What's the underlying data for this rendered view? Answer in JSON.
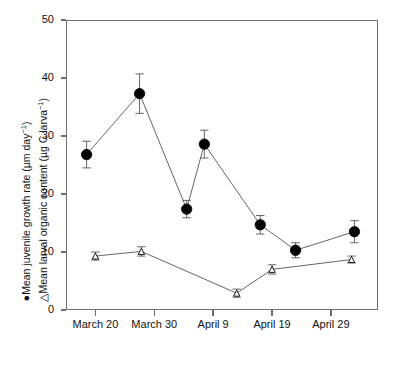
{
  "chart_data": {
    "type": "line",
    "title": "",
    "subtitle": "",
    "xlabel": "",
    "ylabel_line1": "Mean juvenile growth rate (µm day⁻¹)",
    "ylabel_line2": "Mean larval organic content (µg C larva⁻¹)",
    "ylim": [
      0,
      50
    ],
    "yticks": [
      0,
      10,
      20,
      30,
      40,
      50
    ],
    "ytick_labels": [
      "0",
      "10",
      "20",
      "30",
      "40",
      "50"
    ],
    "xtick_labels": [
      "March 20",
      "March 30",
      "April 9",
      "April 19",
      "April 29"
    ],
    "xtick_days": [
      20,
      30,
      40,
      50,
      60
    ],
    "xlim_days": [
      15,
      68
    ],
    "grid": false,
    "legend_position": "y-axis-label",
    "series": [
      {
        "name": "Mean juvenile growth rate (µm day⁻¹)",
        "marker": "filled-circle",
        "legend_symbol": "●",
        "x": [
          18.5,
          27.5,
          35.5,
          38.5,
          48.0,
          54.0,
          64.0
        ],
        "values": [
          26.8,
          37.3,
          17.4,
          28.6,
          14.7,
          10.3,
          13.5
        ],
        "error_up": [
          2.3,
          3.4,
          1.5,
          2.4,
          1.6,
          1.3,
          1.9
        ],
        "error_down": [
          2.3,
          3.4,
          1.5,
          2.4,
          1.6,
          1.3,
          1.9
        ]
      },
      {
        "name": "Mean larval organic content (µg C larva⁻¹)",
        "marker": "open-triangle",
        "legend_symbol": "△",
        "x": [
          20.0,
          27.8,
          44.0,
          50.0,
          63.5
        ],
        "values": [
          9.3,
          10.1,
          2.9,
          7.0,
          8.7
        ],
        "error_up": [
          0.7,
          0.8,
          0.7,
          0.8,
          0.6
        ],
        "error_down": [
          0.7,
          0.8,
          0.7,
          0.8,
          0.6
        ]
      }
    ]
  },
  "axis": {
    "y_title_line1_prefix": "Mean juvenile growth rate (µm day",
    "y_title_line1_suffix": ")",
    "y_title_line2_prefix": "Mean larval organic content (µg C larva",
    "y_title_line2_suffix": ")",
    "exponent": "−1",
    "marker_circle": "●",
    "marker_triangle": "△"
  },
  "style": {
    "axis_color": "#6f6f6f",
    "series_line_color": "#555555",
    "marker_fill": "#000000",
    "marker_stroke": "#000000",
    "background": "#ffffff"
  }
}
